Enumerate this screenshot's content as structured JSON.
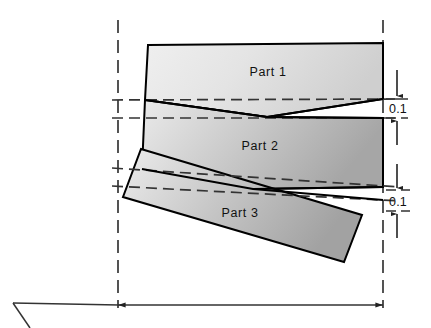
{
  "figure": {
    "type": "engineering-assembly-drawing",
    "background_color": "#ffffff",
    "outline_color": "#000000",
    "centerline_color": "#2a2a2a",
    "dimension_line_color": "#3a3a3a",
    "fill_light": "#ececec",
    "fill_dark": "#a8a8a8",
    "clipped_header_fragment": " "
  },
  "parts": [
    {
      "id": "part-1",
      "label": "Part 1",
      "label_x": 268,
      "label_y": 76,
      "points": "148,45 383,43 383,99 145,100",
      "gradient": "grad-part1"
    },
    {
      "id": "part-2",
      "label": "Part 2",
      "label_x": 260,
      "label_y": 150,
      "points": "147,100 383,118 383,187 142,169",
      "gradient": "grad-part2"
    },
    {
      "id": "part-3",
      "label": "Part 3",
      "label_x": 240,
      "label_y": 217,
      "points": "141,149 362,215 344,262 123,197",
      "gradient": "grad-part3"
    }
  ],
  "notch": {
    "id": "v-notch",
    "vertex_x": 267,
    "vertex_y": 117,
    "upper_edge": "145,100 267,117 383,99",
    "lower_edge": "267,117 383,118"
  },
  "notch_lower": {
    "id": "v-notch-lower",
    "vertex_x": 253,
    "vertex_y": 189,
    "upper_edge": "142,169 253,189 383,187",
    "lower_edge": "253,189 383,200"
  },
  "centerlines": [
    {
      "id": "left-centerline",
      "x": 118,
      "y1": 20,
      "y2": 308
    },
    {
      "id": "right-centerline",
      "x": 383,
      "y1": 20,
      "y2": 308
    }
  ],
  "reference_lines": [
    {
      "id": "ref-line-1",
      "points": "113,100 400,99"
    },
    {
      "id": "ref-line-2",
      "points": "113,118 400,118"
    },
    {
      "id": "ref-line-3",
      "points": "113,169 400,187"
    },
    {
      "id": "ref-line-4",
      "points": "113,187 400,200"
    }
  ],
  "dimensions": [
    {
      "id": "gap-dim-top",
      "value": "0.1",
      "label_x": 392,
      "label_y": 113,
      "arrow_top_x": 397,
      "arrow_top_y1": 73,
      "arrow_top_y2": 97,
      "arrow_bottom_x": 397,
      "arrow_bottom_y1": 142,
      "arrow_bottom_y2": 120
    },
    {
      "id": "gap-dim-bottom",
      "value": "0.1",
      "label_x": 392,
      "label_y": 206,
      "arrow_top_x": 397,
      "arrow_top_y1": 167,
      "arrow_top_y2": 190,
      "arrow_bottom_x": 397,
      "arrow_bottom_y1": 235,
      "arrow_bottom_y2": 212
    },
    {
      "id": "width-dim-bottom",
      "value": "",
      "y": 305,
      "x1": 118,
      "x2": 383,
      "leader_start_x": 13,
      "leader_start_y": 303,
      "leader_corner_x": 28,
      "leader_corner_y": 328
    }
  ],
  "extension_ticks": [
    {
      "id": "ext-tick-left",
      "x": 118,
      "y1": 286,
      "y2": 318
    },
    {
      "id": "ext-tick-right",
      "x": 383,
      "y1": 286,
      "y2": 318
    }
  ]
}
